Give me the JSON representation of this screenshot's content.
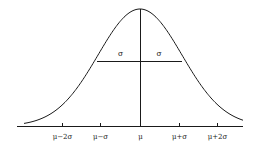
{
  "diagram": {
    "type": "normal-distribution-curve",
    "colors": {
      "line": "#1a1a1a",
      "background": "#ffffff"
    },
    "axis": {
      "x1": 17,
      "x2": 243,
      "y": 126
    },
    "mean_line": {
      "x": 140,
      "y_top": 9,
      "y_bottom": 126
    },
    "sigma_bar": {
      "x1": 97,
      "x2": 182,
      "y": 61,
      "left_label": "σ",
      "right_label": "σ"
    },
    "curve": {
      "center_x": 140,
      "baseline_y": 126,
      "peak_y": 9,
      "sigma_px": 42,
      "x_start": 24,
      "x_end": 243
    },
    "ticks": [
      {
        "x": 62,
        "label": "μ−2σ"
      },
      {
        "x": 100,
        "label": "μ−σ"
      },
      {
        "x": 140,
        "label": "μ"
      },
      {
        "x": 179,
        "label": "μ+σ"
      },
      {
        "x": 217,
        "label": "μ+2σ"
      }
    ]
  }
}
